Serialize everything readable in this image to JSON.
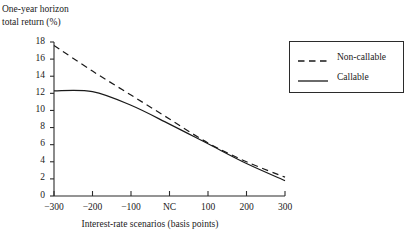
{
  "chart_data": {
    "type": "line",
    "title": "",
    "ylabel": "One-year horizon\ntotal return (%)",
    "xlabel": "Interest-rate scenarios (basis points)",
    "x": [
      -300,
      -200,
      -100,
      0,
      100,
      200,
      300
    ],
    "xtick_labels": [
      "−300",
      "−200",
      "−100",
      "NC",
      "100",
      "200",
      "300"
    ],
    "ytick_labels": [
      "0",
      "2",
      "4",
      "6",
      "8",
      "10",
      "12",
      "14",
      "16",
      "18"
    ],
    "ytick_values": [
      0,
      2,
      4,
      6,
      8,
      10,
      12,
      14,
      16,
      18
    ],
    "xlim": [
      -300,
      300
    ],
    "ylim": [
      0,
      18
    ],
    "grid": false,
    "legend_position": "top-right",
    "series": [
      {
        "name": "Non-callable",
        "style": "dashed",
        "color": "#1a1a1a",
        "values": [
          17.6,
          14.6,
          11.8,
          9.0,
          6.2,
          4.0,
          2.2
        ]
      },
      {
        "name": "Callable",
        "style": "solid",
        "color": "#1a1a1a",
        "values": [
          12.3,
          12.2,
          10.6,
          8.4,
          6.1,
          3.8,
          1.8
        ]
      }
    ],
    "annotations": []
  },
  "legend": {
    "items": [
      {
        "label": "Non-callable",
        "style": "dashed"
      },
      {
        "label": "Callable",
        "style": "solid"
      }
    ]
  },
  "axes": {
    "y_title_line1": "One-year horizon",
    "y_title_line2": "total return (%)",
    "x_title": "Interest-rate scenarios (basis points)"
  }
}
